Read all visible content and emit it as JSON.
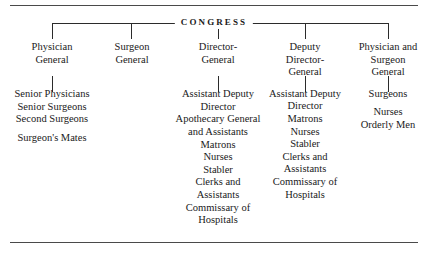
{
  "figure": {
    "root_label": "CONGRESS",
    "rules": {
      "top": true,
      "bottom": true
    }
  },
  "chart_data": {
    "type": "diagram",
    "subtype": "organization-chart",
    "title": "CONGRESS",
    "root": "CONGRESS",
    "branches": [
      {
        "title_lines": [
          "Physician",
          "General"
        ],
        "staff": [
          "Senior Physicians",
          "Senior Surgeons",
          "Second Surgeons",
          "",
          "Surgeon's Mates"
        ],
        "has_connector": true
      },
      {
        "title_lines": [
          "Surgeon",
          "General"
        ],
        "staff": [],
        "has_connector": false
      },
      {
        "title_lines": [
          "Director-",
          "General"
        ],
        "staff": [
          "Assistant Deputy",
          "Director",
          "Apothecary General",
          "and Assistants",
          "Matrons",
          "Nurses",
          "Stabler",
          "Clerks and",
          "Assistants",
          "Commissary of",
          "Hospitals"
        ],
        "has_connector": true
      },
      {
        "title_lines": [
          "Deputy",
          "Director-",
          "General"
        ],
        "staff": [
          "Assistant Deputy",
          "Director",
          "Matrons",
          "Nurses",
          "Stabler",
          "Clerks and",
          "Assistants",
          "Commissary of",
          "Hospitals"
        ],
        "has_connector": true
      },
      {
        "title_lines": [
          "Physician and",
          "Surgeon",
          "General"
        ],
        "staff": [
          "Surgeons",
          "",
          "Nurses",
          "Orderly Men"
        ],
        "has_connector": true
      }
    ]
  },
  "columns": {
    "c1": {
      "title": "Physician\nGeneral",
      "title_l1": "Physician",
      "title_l2": "General",
      "staff_l1": "Senior Physicians",
      "staff_l2": "Senior Surgeons",
      "staff_l3": "Second Surgeons",
      "staff_l4": "Surgeon's Mates"
    },
    "c2": {
      "title_l1": "Surgeon",
      "title_l2": "General"
    },
    "c3": {
      "title_l1": "Director-",
      "title_l2": "General",
      "staff_l1": "Assistant Deputy",
      "staff_l2": "Director",
      "staff_l3": "Apothecary General",
      "staff_l4": "and Assistants",
      "staff_l5": "Matrons",
      "staff_l6": "Nurses",
      "staff_l7": "Stabler",
      "staff_l8": "Clerks and",
      "staff_l9": "Assistants",
      "staff_l10": "Commissary of",
      "staff_l11": "Hospitals"
    },
    "c4": {
      "title_l1": "Deputy",
      "title_l2": "Director-",
      "title_l3": "General",
      "staff_l1": "Assistant Deputy",
      "staff_l2": "Director",
      "staff_l3": "Matrons",
      "staff_l4": "Nurses",
      "staff_l5": "Stabler",
      "staff_l6": "Clerks and",
      "staff_l7": "Assistants",
      "staff_l8": "Commissary of",
      "staff_l9": "Hospitals"
    },
    "c5": {
      "title_l1": "Physician and",
      "title_l2": "Surgeon",
      "title_l3": "General",
      "staff_l1": "Surgeons",
      "staff_l2": "Nurses",
      "staff_l3": "Orderly Men"
    }
  },
  "colors": {
    "background": "#ffffff",
    "text": "#1a1a1a",
    "line": "#2b2b2b",
    "rule": "#4a4a4a"
  }
}
